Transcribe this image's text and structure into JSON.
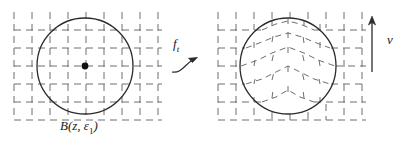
{
  "figure": {
    "background_color": "#ffffff",
    "ink_color": "#2b2b2b",
    "grid_color": "#6e6e6e",
    "width": 407,
    "height": 148
  },
  "left_panel": {
    "name": "source-domain",
    "caption": "B(z, ε1)",
    "caption_parts": {
      "ball": "B",
      "open_paren": "(",
      "center": "z",
      "comma": ", ",
      "epsilon": "ε",
      "subscript": "1",
      "close_paren": ")"
    },
    "grid": {
      "type": "dashed-square-lattice",
      "spacing_px": 18,
      "origin_x": 14,
      "origin_y": 12,
      "cols": 9,
      "rows": 7,
      "distorted": false
    },
    "circle": {
      "cx": 85,
      "cy": 66,
      "r": 48,
      "stroke_width": 1.2
    },
    "center_point": {
      "cx": 85,
      "cy": 66,
      "r": 3.2,
      "fill": "#101010",
      "label": "z"
    }
  },
  "arrow_map": {
    "name": "map-arrow",
    "label": "f",
    "subscript": "t",
    "style": "curved-arrow",
    "direction": "left-to-right"
  },
  "right_panel": {
    "name": "target-domain",
    "grid": {
      "type": "dashed-square-lattice",
      "spacing_px": 18,
      "origin_x": 218,
      "origin_y": 12,
      "cols": 9,
      "rows": 7,
      "distorted": true,
      "distortion": "vertical-bump-inside-ball",
      "distortion_note": "grid lines inside the circle are pushed upward forming chevrons"
    },
    "circle": {
      "cx": 288,
      "cy": 66,
      "r": 48,
      "stroke_width": 1.2
    }
  },
  "vector_field": {
    "name": "direction-vector",
    "label": "v",
    "arrow": {
      "x": 372,
      "y_tail": 70,
      "y_head": 20
    },
    "direction": "up"
  }
}
